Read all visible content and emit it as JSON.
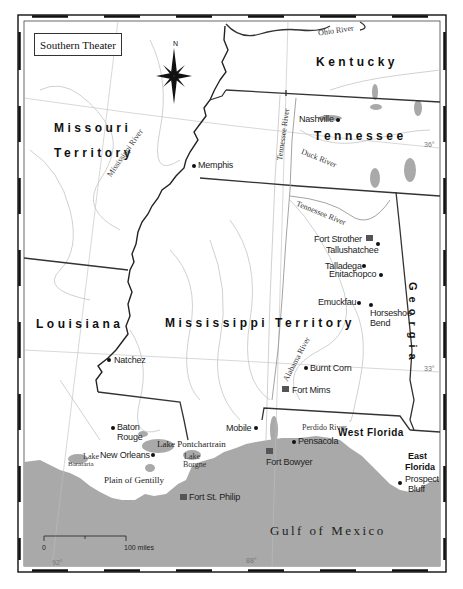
{
  "map": {
    "title": "Southern Theater",
    "compass": {
      "label": "N"
    },
    "regions": {
      "missouri_1": "Missouri",
      "missouri_2": "Territory",
      "kentucky": "Kentucky",
      "tennessee": "Tennessee",
      "georgia": "Georgia",
      "louisiana": "Louisiana",
      "mississippi": "Mississippi Territory",
      "west_florida": "West Florida",
      "east_florida_1": "East",
      "east_florida_2": "Florida"
    },
    "places": {
      "memphis": "Memphis",
      "nashville": "Nashville",
      "fort_strother": "Fort Strother",
      "tallushatchee": "Tallushatchee",
      "talladega": "Talladega",
      "enitachopco": "Enitachopco",
      "emuckfau": "Emuckfau",
      "horseshoe_1": "Horseshoe",
      "horseshoe_2": "Bend",
      "natchez": "Natchez",
      "burnt_corn": "Burnt Corn",
      "fort_mims": "Fort Mims",
      "baton_1": "Baton",
      "baton_2": "Rouge",
      "mobile": "Mobile",
      "pensacola": "Pensacola",
      "new_orleans": "New Orleans",
      "fort_bowyer": "Fort Bowyer",
      "fort_st_philip": "Fort St. Philip",
      "prospect_1": "Prospect",
      "prospect_2": "Bluff",
      "plain_gentilly": "Plain of Gentilly"
    },
    "rivers": {
      "ohio": "Ohio River",
      "mississippi": "Mississippi River",
      "tennessee_north": "Tennessee River",
      "tennessee_south": "Tennessee River",
      "duck": "Duck River",
      "alabama": "Alabama River",
      "perdido": "Perdido River"
    },
    "water_bodies": {
      "lake_pontchartrain": "Lake Pontchartrain",
      "lake_borgne_1": "Lake",
      "lake_borgne_2": "Borgne",
      "lake_barataria_1": "Lake",
      "lake_barataria_2": "Barataria",
      "gulf": "Gulf of Mexico"
    },
    "graticule": {
      "lat_36": "36°",
      "lat_33": "33°",
      "lon_92": "92°",
      "lon_88": "88°"
    },
    "scale": {
      "start": "0",
      "end": "100 miles"
    },
    "colors": {
      "sea": "#a9a9a9",
      "land": "#ffffff",
      "border": "#333333",
      "river": "#c4c4c4"
    }
  }
}
